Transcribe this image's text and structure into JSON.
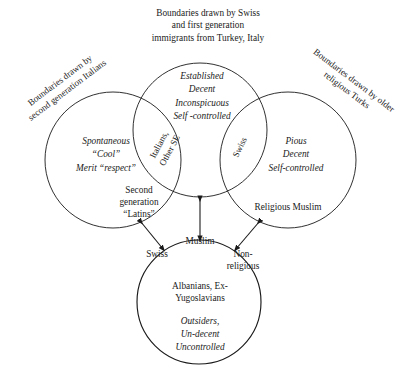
{
  "diagram": {
    "type": "venn-diagram",
    "background_color": "#ffffff",
    "stroke_color": "#1a1a1a"
  },
  "captions": {
    "top": "Boundaries drawn by Swiss\nand first generation\nimmigrants from Turkey, Italy",
    "left": "Boundaries drawn by\nsecond generation Italians",
    "right": "Boundaries drawn by older\nreligious Turks"
  },
  "circles": {
    "top": {
      "name": "established-circle",
      "traits": "Established\nDecent\nInconspicuous\nSelf -controlled",
      "cx": 200,
      "cy": 130,
      "r": 67
    },
    "left": {
      "name": "second-generation-latins-circle",
      "traits": "Spontaneous\n“Cool”\nMerit “respect”",
      "group_label": "Second\ngeneration\n“Latins”",
      "cx": 113,
      "cy": 160,
      "r": 68
    },
    "right": {
      "name": "religious-muslim-circle",
      "traits": "Pious\nDecent\nSelf-controlled",
      "group_label": "Religious Muslim",
      "cx": 288,
      "cy": 160,
      "r": 68
    },
    "bottom": {
      "name": "outsiders-circle",
      "group_label": "Albanians, Ex-\nYugoslavians",
      "traits": "Outsiders,\nUn-decent\nUncontrolled",
      "cx": 199,
      "cy": 302,
      "r": 62
    }
  },
  "lens_labels": {
    "left_lens": "Italians,\nOther SE",
    "right_lens": "Swiss"
  },
  "bottom_labels": {
    "muslim": "Muslim",
    "swiss": "Swiss",
    "non_religious": "Non-\nreligious"
  },
  "connectors": [
    {
      "name": "arrow-left-to-bottom",
      "kind": "double-headed-arrow"
    },
    {
      "name": "arrow-top-to-bottom",
      "kind": "double-headed-arrow"
    },
    {
      "name": "arrow-right-to-bottom",
      "kind": "double-headed-arrow"
    }
  ]
}
